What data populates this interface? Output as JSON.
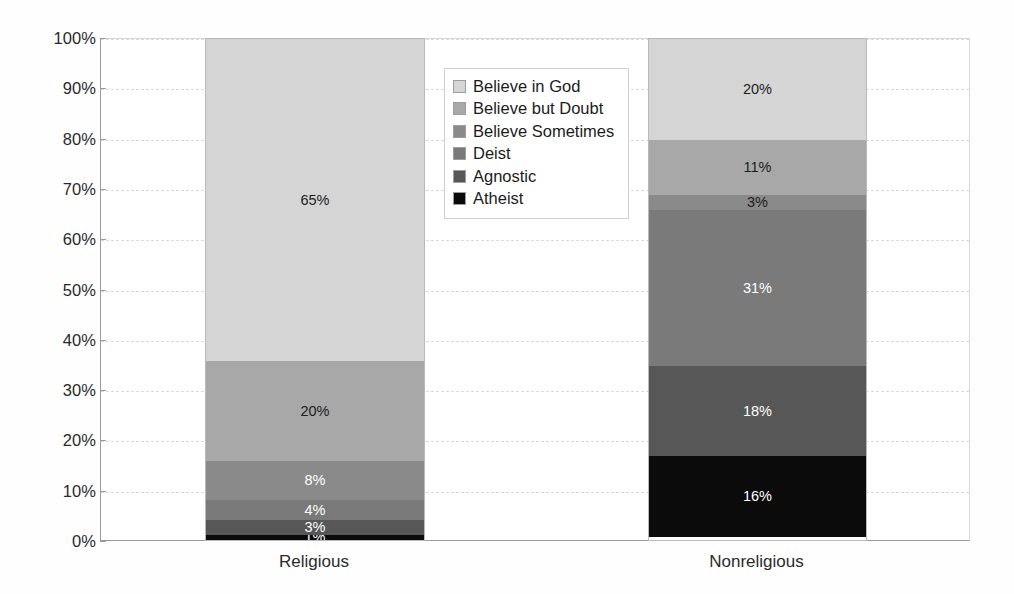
{
  "chart_data": {
    "type": "bar",
    "subtype": "stacked-bar-100-percent",
    "title": "",
    "xlabel": "",
    "ylabel": "",
    "ylim": [
      0,
      100
    ],
    "ytick_labels": [
      "0%",
      "10%",
      "20%",
      "30%",
      "40%",
      "50%",
      "60%",
      "70%",
      "80%",
      "90%",
      "100%"
    ],
    "ytick_values": [
      0,
      10,
      20,
      30,
      40,
      50,
      60,
      70,
      80,
      90,
      100
    ],
    "grid": true,
    "legend_position": "upper-center",
    "categories": [
      "Religious",
      "Nonreligious"
    ],
    "stack_order_bottom_to_top": [
      "Atheist",
      "Agnostic",
      "Deist",
      "Believe Sometimes",
      "Believe but Doubt",
      "Believe in God"
    ],
    "series": [
      {
        "name": "Believe in God",
        "color": "#d5d5d5",
        "values": [
          65,
          20
        ],
        "labels": [
          "65%",
          "20%"
        ],
        "label_colors": [
          "#1c1c1c",
          "#1c1c1c"
        ]
      },
      {
        "name": "Believe but Doubt",
        "color": "#a8a8a8",
        "values": [
          20,
          11
        ],
        "labels": [
          "20%",
          "11%"
        ],
        "label_colors": [
          "#1c1c1c",
          "#1c1c1c"
        ]
      },
      {
        "name": "Believe Sometimes",
        "color": "#8a8a8a",
        "values": [
          8,
          3
        ],
        "labels": [
          "8%",
          "3%"
        ],
        "label_colors": [
          "#ffffff",
          "#1c1c1c"
        ]
      },
      {
        "name": "Deist",
        "color": "#7a7a7a",
        "values": [
          4,
          31
        ],
        "labels": [
          "4%",
          "31%"
        ],
        "label_colors": [
          "#ffffff",
          "#ffffff"
        ]
      },
      {
        "name": "Agnostic",
        "color": "#575757",
        "values": [
          3,
          18
        ],
        "labels": [
          "3%",
          "18%"
        ],
        "label_colors": [
          "#ffffff",
          "#ffffff"
        ]
      },
      {
        "name": "Atheist",
        "color": "#0b0b0b",
        "values": [
          1,
          16
        ],
        "labels": [
          "1%",
          "16%"
        ],
        "label_colors": [
          "#ffffff",
          "#ffffff"
        ]
      }
    ],
    "legend_entries": [
      {
        "label": "Believe in God",
        "color": "#d5d5d5"
      },
      {
        "label": "Believe but Doubt",
        "color": "#a8a8a8"
      },
      {
        "label": "Believe Sometimes",
        "color": "#8a8a8a"
      },
      {
        "label": "Deist",
        "color": "#7a7a7a"
      },
      {
        "label": "Agnostic",
        "color": "#575757"
      },
      {
        "label": "Atheist",
        "color": "#0b0b0b"
      }
    ]
  },
  "layout": {
    "plot_left": 100,
    "plot_top": 38,
    "plot_width": 870,
    "plot_height": 503,
    "bars": [
      {
        "left": 205,
        "width": 218
      },
      {
        "left": 648,
        "width": 217
      }
    ]
  }
}
